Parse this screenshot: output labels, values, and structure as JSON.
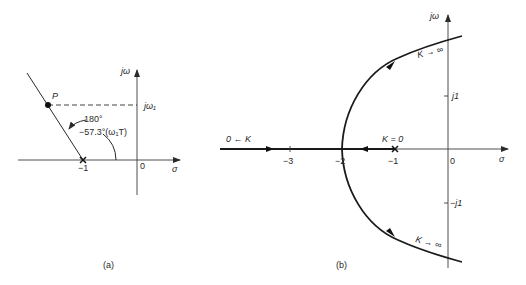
{
  "figure_a": {
    "caption": "(a)",
    "axis_x_label": "σ",
    "axis_y_label": "jω",
    "point_label": "P",
    "jw1_label": "jω₁",
    "pole_label": "−1",
    "origin_label": "0",
    "angle_line1": "180°",
    "angle_line2": "−57.3°(ω₁T)"
  },
  "figure_b": {
    "caption": "(b)",
    "axis_x_label": "σ",
    "axis_y_label": "jω",
    "ticks_x": [
      "−3",
      "−2",
      "−1",
      "0"
    ],
    "tick_j1": "j1",
    "tick_mj1": "−j1",
    "k_zero_label": "K = 0",
    "k_to_zero_label": "0 ← K",
    "k_inf_upper": "K → ∞",
    "k_inf_lower": "K → ∞"
  }
}
